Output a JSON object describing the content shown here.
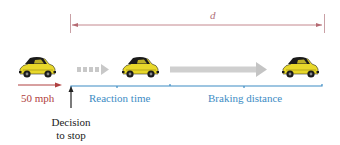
{
  "diagram": {
    "distance_label": "d",
    "speed_label": "50 mph",
    "reaction_label": "Reaction time",
    "braking_label": "Braking distance",
    "decision_label_line1": "Decision",
    "decision_label_line2": "to stop",
    "colors": {
      "distance_arrow": "#b56a72",
      "speed_arrow": "#b04040",
      "bracket": "#3d8cc4",
      "motion_arrow": "#c8c8c8",
      "car_body": "#e8d82a",
      "car_dark": "#1a1a1a",
      "decision_arrow": "#222222"
    },
    "cars": [
      {
        "position": "start",
        "x": 37
      },
      {
        "position": "after-reaction",
        "x": 140
      },
      {
        "position": "stopped",
        "x": 300
      }
    ]
  }
}
